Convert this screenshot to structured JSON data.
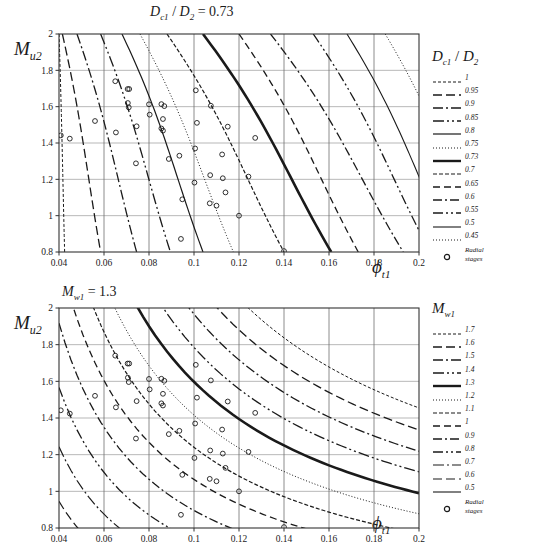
{
  "figure": {
    "width": 534,
    "height": 558,
    "background": "#ffffff",
    "line_color": "#1a1a1a",
    "grid_color": "#999999",
    "marker_label": "Radial stages"
  },
  "chart_data": [
    {
      "id": "top",
      "type": "line",
      "title": "D_c1 / D_2 = 0.73",
      "title_parts": {
        "main": "D",
        "sub1": "c1",
        "mid": " / ",
        "main2": "D",
        "sub2": "2",
        "eq": " = 0.73"
      },
      "xlabel": "φ_t1",
      "ylabel": "M_u2",
      "xlim": [
        0.04,
        0.2
      ],
      "ylim": [
        0.8,
        2.0
      ],
      "xticks": [
        0.04,
        0.06,
        0.08,
        0.1,
        0.12,
        0.14,
        0.16,
        0.18,
        0.2
      ],
      "xtick_labels": [
        "0.04",
        "0.06",
        "0.08",
        "0.1",
        "0.12",
        "0.14",
        "0.16",
        "0.18",
        "0.2"
      ],
      "yticks": [
        0.8,
        1.0,
        1.2,
        1.4,
        1.6,
        1.8,
        2.0
      ],
      "ytick_labels": [
        "0.8",
        "1",
        "1.2",
        "1.4",
        "1.6",
        "1.8",
        "2"
      ],
      "grid": true,
      "legend_title": "D_c1 / D_2",
      "legend_position": "right",
      "series": [
        {
          "name": "1",
          "dash": "3,2",
          "width": 1.0,
          "x_at_ymax": 0.04,
          "x_at_ymin": 0.0425
        },
        {
          "name": "0.95",
          "dash": "9,4",
          "width": 1.3,
          "x_at_ymax": 0.0415,
          "x_at_ymin": 0.0585
        },
        {
          "name": "0.9",
          "dash": "10,3,2,3",
          "width": 1.3,
          "x_at_ymax": 0.048,
          "x_at_ymin": 0.0745
        },
        {
          "name": "0.85",
          "dash": "11,3,2,3,2,3",
          "width": 1.3,
          "x_at_ymax": 0.0585,
          "x_at_ymin": 0.0895
        },
        {
          "name": "0.8",
          "dash": "none",
          "width": 1.2,
          "x_at_ymax": 0.068,
          "x_at_ymin": 0.104
        },
        {
          "name": "0.75",
          "dash": "1,2",
          "width": 1.0,
          "x_at_ymax": 0.076,
          "x_at_ymin": 0.1175
        },
        {
          "name": "0.7",
          "dash": "4,2",
          "width": 1.2,
          "x_at_ymax": 0.088,
          "x_at_ymin": 0.14
        },
        {
          "name": "0.65",
          "dash": "7,4",
          "width": 1.3,
          "x_at_ymax": 0.12,
          "x_at_ymin": 0.173
        },
        {
          "name": "0.6",
          "dash": "9,3,2,3",
          "width": 1.3,
          "x_at_ymax": 0.134,
          "x_at_ymin": 0.193
        },
        {
          "name": "0.55",
          "dash": "10,3,2,3,2,3",
          "width": 1.3,
          "x_at_ymax": 0.153,
          "x_at_ymin": 0.205
        },
        {
          "name": "0.5",
          "dash": "none",
          "width": 1.1,
          "x_at_ymax": 0.168,
          "x_at_ymin": 0.215
        },
        {
          "name": "0.45",
          "dash": "1,2",
          "width": 1.0,
          "x_at_ymax": 0.185,
          "x_at_ymin": 0.23
        }
      ],
      "highlight_series": {
        "name": "0.73",
        "width": 2.6,
        "x_at_ymax": 0.104,
        "x_at_ymin": 0.161
      },
      "points": [
        [
          0.0408,
          1.442
        ],
        [
          0.0448,
          1.424
        ],
        [
          0.056,
          1.521
        ],
        [
          0.065,
          1.74
        ],
        [
          0.0653,
          1.458
        ],
        [
          0.0705,
          1.697
        ],
        [
          0.0712,
          1.697
        ],
        [
          0.0706,
          1.62
        ],
        [
          0.071,
          1.596
        ],
        [
          0.0745,
          1.492
        ],
        [
          0.0742,
          1.288
        ],
        [
          0.08,
          1.613
        ],
        [
          0.0803,
          1.556
        ],
        [
          0.0855,
          1.614
        ],
        [
          0.0868,
          1.603
        ],
        [
          0.0862,
          1.532
        ],
        [
          0.0855,
          1.48
        ],
        [
          0.0862,
          1.468
        ],
        [
          0.0888,
          1.312
        ],
        [
          0.0935,
          1.33
        ],
        [
          0.0942,
          0.872
        ],
        [
          0.1008,
          1.69
        ],
        [
          0.1013,
          1.511
        ],
        [
          0.1005,
          1.37
        ],
        [
          0.1002,
          1.182
        ],
        [
          0.0948,
          1.09
        ],
        [
          0.1075,
          1.605
        ],
        [
          0.1072,
          1.223
        ],
        [
          0.107,
          1.068
        ],
        [
          0.11,
          1.055
        ],
        [
          0.1125,
          1.337
        ],
        [
          0.1128,
          1.206
        ],
        [
          0.114,
          1.128
        ],
        [
          0.115,
          1.49
        ],
        [
          0.12,
          1.0
        ],
        [
          0.1242,
          1.215
        ],
        [
          0.1272,
          1.428
        ],
        [
          0.14,
          0.805
        ]
      ]
    },
    {
      "id": "bottom",
      "type": "line",
      "title": "M_w1 = 1.3",
      "title_parts": {
        "main": "M",
        "sub1": "w1",
        "eq": " = 1.3"
      },
      "xlabel": "φ_t1",
      "ylabel": "M_u2",
      "xlim": [
        0.04,
        0.2
      ],
      "ylim": [
        0.8,
        2.0
      ],
      "xticks": [
        0.04,
        0.06,
        0.08,
        0.1,
        0.12,
        0.14,
        0.16,
        0.18,
        0.2
      ],
      "xtick_labels": [
        "0.04",
        "0.06",
        "0.08",
        "0.1",
        "0.12",
        "0.14",
        "0.16",
        "0.18",
        "0.2"
      ],
      "yticks": [
        0.8,
        1.0,
        1.2,
        1.4,
        1.6,
        1.8,
        2.0
      ],
      "ytick_labels": [
        "0.8",
        "1",
        "1.2",
        "1.4",
        "1.6",
        "1.8",
        "2"
      ],
      "grid": true,
      "legend_title": "M_w1",
      "legend_position": "right",
      "series": [
        {
          "name": "1.7",
          "dash": "3,2",
          "width": 1.0,
          "k": 0.388
        },
        {
          "name": "1.6",
          "dash": "9,4",
          "width": 1.3,
          "k": 0.356
        },
        {
          "name": "1.5",
          "dash": "10,3,2,3",
          "width": 1.3,
          "k": 0.325
        },
        {
          "name": "1.4",
          "dash": "11,3,2,3,2,3",
          "width": 1.3,
          "k": 0.295
        },
        {
          "name": "1.2",
          "dash": "1,2",
          "width": 1.0,
          "k": 0.234
        },
        {
          "name": "1.1",
          "dash": "4,2",
          "width": 1.2,
          "k": 0.205
        },
        {
          "name": "1",
          "dash": "7,4",
          "width": 1.3,
          "k": 0.176
        },
        {
          "name": "0.9",
          "dash": "9,3,2,3",
          "width": 1.3,
          "k": 0.148
        },
        {
          "name": "0.8",
          "dash": "10,3,2,3,2,3",
          "width": 1.3,
          "k": 0.121
        },
        {
          "name": "0.7",
          "dash": "11,3,2,3",
          "width": 1.2,
          "k": 0.096
        },
        {
          "name": "0.6",
          "dash": "9,4",
          "width": 1.2,
          "k": 0.073
        },
        {
          "name": "0.5",
          "dash": "none",
          "width": 1.1,
          "k": 0.052
        }
      ],
      "highlight_series": {
        "name": "1.3",
        "width": 2.6,
        "k": 0.264
      },
      "points": [
        [
          0.0408,
          1.442
        ],
        [
          0.0448,
          1.424
        ],
        [
          0.056,
          1.521
        ],
        [
          0.065,
          1.74
        ],
        [
          0.0653,
          1.458
        ],
        [
          0.0705,
          1.697
        ],
        [
          0.0712,
          1.697
        ],
        [
          0.0706,
          1.62
        ],
        [
          0.071,
          1.596
        ],
        [
          0.0745,
          1.492
        ],
        [
          0.0742,
          1.288
        ],
        [
          0.08,
          1.613
        ],
        [
          0.0803,
          1.556
        ],
        [
          0.0855,
          1.614
        ],
        [
          0.0868,
          1.603
        ],
        [
          0.0862,
          1.532
        ],
        [
          0.0855,
          1.48
        ],
        [
          0.0862,
          1.468
        ],
        [
          0.0888,
          1.312
        ],
        [
          0.0935,
          1.33
        ],
        [
          0.0942,
          0.872
        ],
        [
          0.1008,
          1.69
        ],
        [
          0.1013,
          1.511
        ],
        [
          0.1005,
          1.37
        ],
        [
          0.1002,
          1.182
        ],
        [
          0.0948,
          1.09
        ],
        [
          0.1075,
          1.605
        ],
        [
          0.1072,
          1.223
        ],
        [
          0.107,
          1.068
        ],
        [
          0.11,
          1.055
        ],
        [
          0.1125,
          1.337
        ],
        [
          0.1128,
          1.206
        ],
        [
          0.114,
          1.128
        ],
        [
          0.115,
          1.49
        ],
        [
          0.12,
          1.0
        ],
        [
          0.1242,
          1.215
        ],
        [
          0.1272,
          1.428
        ],
        [
          0.14,
          0.805
        ]
      ]
    }
  ]
}
